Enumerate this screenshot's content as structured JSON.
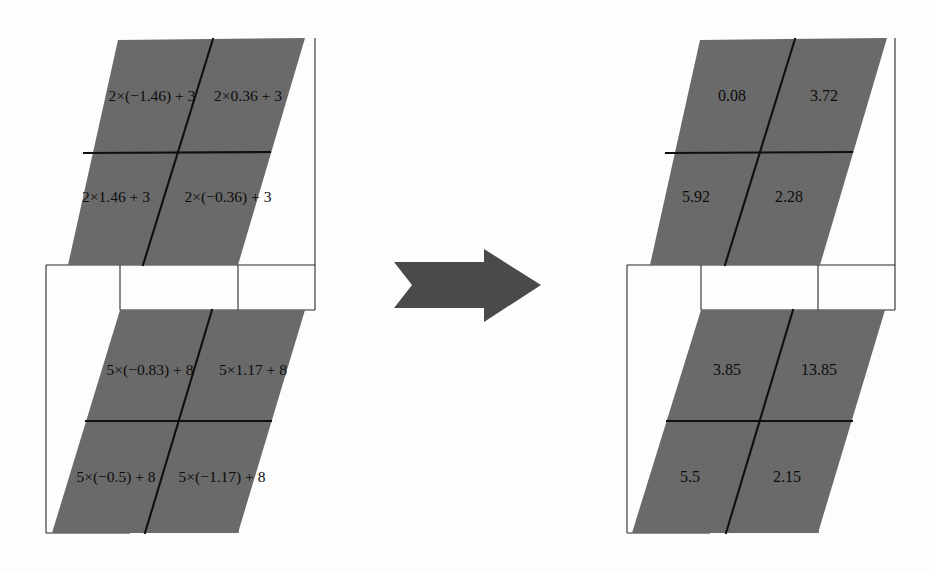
{
  "figure": {
    "type": "diagram",
    "colors": {
      "slab_fill": "#6b6b6b",
      "grid_line": "#101010",
      "frame_line": "#2b2b2b",
      "arrow_fill": "#4b4b4b",
      "background": "#ffffff",
      "text": "#0d0d0d"
    }
  },
  "left_group": {
    "name": "expressions",
    "front_slab": {
      "name": "front-expression-slab",
      "cells": [
        {
          "position": "top-left",
          "text": "2×(−1.46) + 3"
        },
        {
          "position": "top-right",
          "text": "2×0.36 + 3"
        },
        {
          "position": "bottom-left",
          "text": "2×1.46 + 3"
        },
        {
          "position": "bottom-right",
          "text": "2×(−0.36) + 3"
        }
      ]
    },
    "back_slab": {
      "name": "back-expression-slab",
      "cells": [
        {
          "position": "top-left",
          "text": "5×(−0.83) + 8"
        },
        {
          "position": "top-right",
          "text": "5×1.17 + 8"
        },
        {
          "position": "bottom-left",
          "text": "5×(−0.5) + 8"
        },
        {
          "position": "bottom-right",
          "text": "5×(−1.17) + 8"
        }
      ]
    }
  },
  "arrow": {
    "name": "transform-arrow",
    "direction": "right",
    "style": "block-arrow-notched-tail",
    "label": ""
  },
  "right_group": {
    "name": "results",
    "front_slab": {
      "name": "front-result-slab",
      "cells": [
        {
          "position": "top-left",
          "text": "0.08"
        },
        {
          "position": "top-right",
          "text": "3.72"
        },
        {
          "position": "bottom-left",
          "text": "5.92"
        },
        {
          "position": "bottom-right",
          "text": "2.28"
        }
      ]
    },
    "back_slab": {
      "name": "back-result-slab",
      "cells": [
        {
          "position": "top-left",
          "text": "3.85"
        },
        {
          "position": "top-right",
          "text": "13.85"
        },
        {
          "position": "bottom-left",
          "text": "5.5"
        },
        {
          "position": "bottom-right",
          "text": "2.15"
        }
      ]
    }
  }
}
